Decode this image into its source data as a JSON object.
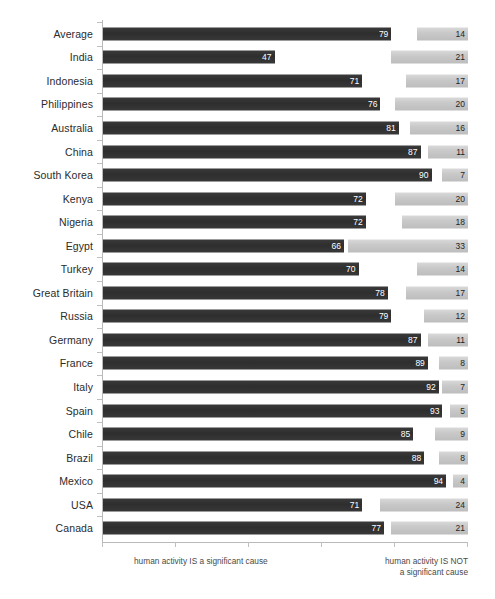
{
  "chart_data": {
    "type": "bar",
    "orientation": "horizontal",
    "title": "",
    "subtitle": "",
    "xlabel": "",
    "ylabel": "",
    "xlim": [
      0,
      100
    ],
    "grid": false,
    "legend_position": "none",
    "stacked_from_both_ends": true,
    "axis_captions": {
      "left": "human activity IS a significant cause",
      "right_line1": "human activity IS NOT",
      "right_line2": "a significant cause"
    },
    "colors": {
      "positive_bar": "#333333",
      "negative_bar": "#c9c9c9",
      "positive_label_text": "#ffffff",
      "negative_label_text": "#1f1f1f",
      "axis_line": "#b9b9b9",
      "background": "#ffffff",
      "category_label_text": "#2b2b2b"
    },
    "x_tick_values": [
      0,
      20,
      40,
      60,
      80,
      100
    ],
    "categories": [
      "Average",
      "India",
      "Indonesia",
      "Philippines",
      "Australia",
      "China",
      "South Korea",
      "Kenya",
      "Nigeria",
      "Egypt",
      "Turkey",
      "Great Britain",
      "Russia",
      "Germany",
      "France",
      "Italy",
      "Spain",
      "Chile",
      "Brazil",
      "Mexico",
      "USA",
      "Canada"
    ],
    "series": [
      {
        "name": "human activity IS a significant cause",
        "values": [
          79,
          47,
          71,
          76,
          81,
          87,
          90,
          72,
          72,
          66,
          70,
          78,
          79,
          87,
          89,
          92,
          93,
          85,
          88,
          94,
          71,
          77
        ]
      },
      {
        "name": "human activity IS NOT a significant cause",
        "values": [
          14,
          21,
          17,
          20,
          16,
          11,
          7,
          20,
          18,
          33,
          14,
          17,
          12,
          11,
          8,
          7,
          5,
          9,
          8,
          4,
          24,
          21
        ]
      }
    ]
  }
}
